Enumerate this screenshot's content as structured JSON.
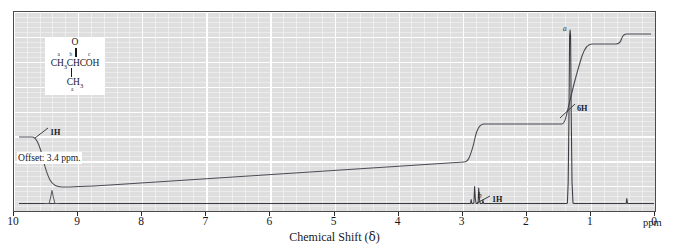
{
  "figure": {
    "kind": "nmr-spectrum",
    "compound_name": "2-methylpropanoic acid (isobutyric acid)",
    "structure": {
      "carbonyl_oxygen": "O",
      "main_chain": "CH3CHCOH",
      "branch": "CH3",
      "labels": {
        "a": "a",
        "b": "b",
        "c": "c",
        "a2": "a"
      }
    },
    "annotations": {
      "offset_note": "Offset: 3.4 ppm.",
      "integral_left": "1H",
      "integral_mid": "1H",
      "integral_right": "6H",
      "peak_label_b": "b",
      "peak_label_a": "a"
    }
  },
  "axis": {
    "title_text": "Chemical Shift (",
    "title_delta": "δ",
    "title_close": ")",
    "unit": "ppm",
    "ticks": [
      "10",
      "9",
      "8",
      "7",
      "6",
      "5",
      "4",
      "3",
      "2",
      "1",
      "0"
    ],
    "min": 0,
    "max": 10,
    "direction": "reversed"
  },
  "colors": {
    "plot_background": "#dedede",
    "grid": "#ffffff",
    "trace": "#3a3a42",
    "frame": "#4a4a4a",
    "text": "#17171c"
  },
  "chart_data": {
    "type": "line",
    "title": "",
    "xlabel": "Chemical Shift (δ)",
    "ylabel": "",
    "xlim": [
      10,
      0
    ],
    "ylim": [
      0,
      100
    ],
    "grid": true,
    "legend": "none",
    "series": [
      {
        "name": "spectrum-trace",
        "description": "1H NMR trace of isobutyric acid, baseline near bottom with three resonances",
        "peaks": [
          {
            "label": "c",
            "shift_ppm": 12.0,
            "note": "COOH, offset 3.4 ppm, drawn at far left",
            "integration": "1H",
            "height_rel": 30,
            "multiplicity": "singlet (broad)"
          },
          {
            "label": "b",
            "shift_ppm": 2.6,
            "integration": "1H",
            "height_rel": 12,
            "multiplicity": "septet"
          },
          {
            "label": "a",
            "shift_ppm": 1.2,
            "integration": "6H",
            "height_rel": 96,
            "multiplicity": "doublet"
          },
          {
            "label": "TMS",
            "shift_ppm": 0.0,
            "integration": "",
            "height_rel": 4,
            "multiplicity": "singlet"
          }
        ]
      },
      {
        "name": "integration-trace",
        "description": "stepped integral curve rising right-to-left across the spectrum",
        "steps": [
          {
            "at_ppm": 1.2,
            "rise_rel": 72,
            "assignment": "6H"
          },
          {
            "at_ppm": 2.6,
            "rise_rel": 12,
            "assignment": "1H"
          },
          {
            "at_ppm": 9.7,
            "rise_rel": 14,
            "assignment": "1H"
          }
        ]
      }
    ]
  }
}
